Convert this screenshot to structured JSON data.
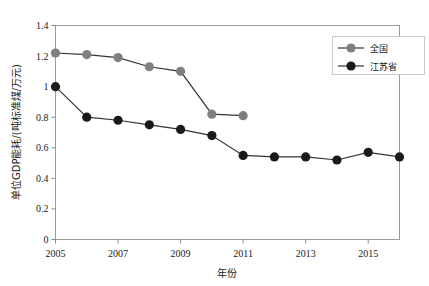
{
  "chart_data": {
    "type": "line",
    "title": "",
    "xlabel": "年份",
    "ylabel": "单位GDP能耗/(吨标准煤/万元)",
    "xlim": [
      2005,
      2016
    ],
    "ylim": [
      0,
      1.4
    ],
    "grid": false,
    "legend_position": "right-top",
    "x_ticks": [
      2005,
      2007,
      2009,
      2011,
      2013,
      2015
    ],
    "x_tick_labels": [
      "2005",
      "2007",
      "2009",
      "2011",
      "2013",
      "2015"
    ],
    "y_ticks": [
      0,
      0.2,
      0.4,
      0.6,
      0.8,
      1,
      1.2,
      1.4
    ],
    "y_tick_labels": [
      "0",
      "0.2",
      "0.4",
      "0.6",
      "0.8",
      "1",
      "1.2",
      "1.4"
    ],
    "series": [
      {
        "name": "全国",
        "color": "#7f7f7f",
        "marker": "circle",
        "x": [
          2005,
          2006,
          2007,
          2008,
          2009,
          2010,
          2011
        ],
        "values": [
          1.22,
          1.21,
          1.19,
          1.13,
          1.1,
          0.82,
          0.81
        ]
      },
      {
        "name": "江苏省",
        "color": "#1a1a1a",
        "marker": "circle",
        "x": [
          2005,
          2006,
          2007,
          2008,
          2009,
          2010,
          2011,
          2012,
          2013,
          2014,
          2015,
          2016
        ],
        "values": [
          1.0,
          0.8,
          0.78,
          0.75,
          0.72,
          0.68,
          0.55,
          0.54,
          0.54,
          0.52,
          0.57,
          0.54
        ]
      }
    ]
  },
  "legend": {
    "items": [
      {
        "label": "全国",
        "color": "#7f7f7f"
      },
      {
        "label": "江苏省",
        "color": "#1a1a1a"
      }
    ]
  },
  "axes": {
    "x_title": "年份",
    "y_title": "单位GDP能耗/(吨标准煤/万元)"
  }
}
